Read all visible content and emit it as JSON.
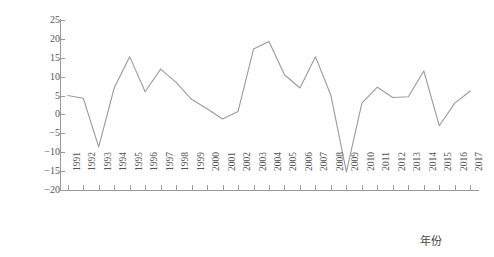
{
  "chart_data": {
    "type": "line",
    "title": "",
    "xlabel": "年份",
    "ylabel": "增加值增速/%",
    "x": [
      1991,
      1992,
      1993,
      1994,
      1995,
      1996,
      1997,
      1998,
      1999,
      2000,
      2001,
      2002,
      2003,
      2004,
      2005,
      2006,
      2007,
      2008,
      2009,
      2010,
      2011,
      2012,
      2013,
      2014,
      2015,
      2016,
      2017
    ],
    "categories": [
      "1991",
      "1992",
      "1993",
      "1994",
      "1995",
      "1996",
      "1997",
      "1998",
      "1999",
      "2000",
      "2001",
      "2002",
      "2003",
      "2004",
      "2005",
      "2006",
      "2007",
      "2008",
      "2009",
      "2010",
      "2011",
      "2012",
      "2013",
      "2014",
      "2015",
      "2016",
      "2017"
    ],
    "values": [
      5.0,
      4.3,
      -8.6,
      7.0,
      15.3,
      6.0,
      12.0,
      8.5,
      4.0,
      1.5,
      -1.2,
      0.8,
      17.3,
      19.3,
      10.5,
      7.0,
      15.3,
      5.0,
      -15.2,
      3.0,
      7.2,
      4.5,
      4.7,
      11.5,
      -3.0,
      3.0,
      6.2
    ],
    "series": [
      {
        "name": "增加值增速",
        "values": [
          5.0,
          4.3,
          -8.6,
          7.0,
          15.3,
          6.0,
          12.0,
          8.5,
          4.0,
          1.5,
          -1.2,
          0.8,
          17.3,
          19.3,
          10.5,
          7.0,
          15.3,
          5.0,
          -15.2,
          3.0,
          7.2,
          4.5,
          4.7,
          11.5,
          -3.0,
          3.0,
          6.2
        ]
      }
    ],
    "ylim": [
      -20,
      25
    ],
    "y_ticks": [
      25,
      20,
      15,
      10,
      5,
      0,
      -5,
      -10,
      -15,
      -20
    ],
    "y_tick_labels": [
      "25",
      "20",
      "15",
      "10",
      "5",
      "0",
      "-5",
      "-10",
      "-15",
      "-20"
    ],
    "grid": false,
    "legend": "none",
    "line_color": "#9a9a9a",
    "axis_color": "#9a9a9a",
    "text_color": "#555555",
    "background_color": "#ffffff"
  }
}
